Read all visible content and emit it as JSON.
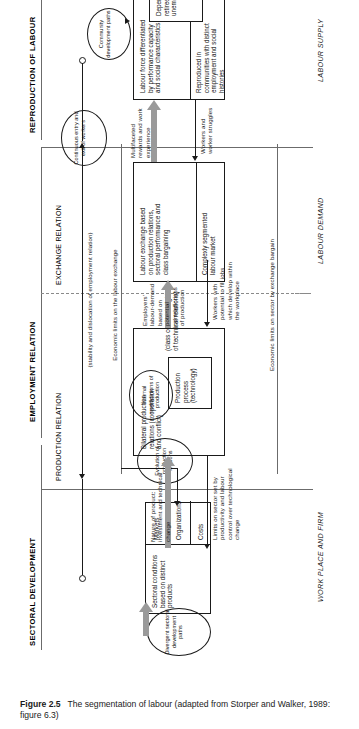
{
  "figure": {
    "number": "Figure 2.5",
    "caption": "The segmentation of labour (adapted from Storper and Walker, 1989: figure 6.3)"
  },
  "bands": [
    {
      "id": "sectoral",
      "heading": "SECTORAL DEVELOPMENT",
      "subheadings": [],
      "role": "WORK PLACE AND FIRM"
    },
    {
      "id": "employment",
      "heading": "EMPLOYMENT RELATION",
      "subheadings": [
        "PRODUCTION RELATION",
        "EXCHANGE RELATION"
      ],
      "role": "LABOUR DEMAND"
    },
    {
      "id": "reproduction",
      "heading": "REPRODUCTION OF LABOUR",
      "subheadings": [],
      "role": "LABOUR SUPPLY"
    }
  ],
  "roles": {
    "work_place": "WORK PLACE AND FIRM",
    "labour_demand": "LABOUR DEMAND",
    "labour_supply": "LABOUR SUPPLY"
  },
  "axis_note": "(stability and dislocation of employment relation)",
  "boxes": {
    "sectoral_conditions": {
      "title": "Sectoral conditions based on distinct products",
      "rows": [
        "Markets",
        "Organizations",
        "Costs"
      ]
    },
    "bilateral": {
      "title": "Bilateral production relations (cooperation and conflict)",
      "inner": "Production process (technology)",
      "note": "(class conflict in light of technical relations)"
    },
    "labour_exchange": {
      "title": "Labour exchange based on production relations, sectoral performance and class bargaining",
      "segment": "Complexly segmented labour market"
    },
    "labour_force": {
      "title": "Labour force differentiated by performance capacity and social characteristics",
      "segment": "Reproduced in communities with distinct employment and social histories"
    },
    "dependents": {
      "title": "Dependents, retirees and unemployed"
    }
  },
  "ellipses": {
    "divergent": "Divergent sectoral development paths",
    "evolution": "Evolution of production relations",
    "internal": "Internal modifications of production",
    "continuous": "Continuous entry and exit of workers",
    "community": "Community development paths"
  },
  "flow_labels": {
    "nature_of_product": "Nature of product: investment and technical change",
    "limits_on_sector": "Limits on sector set by productivity and labour control over technological change",
    "employers_demand": "Employers' labour-demand based on potential contradictions of production",
    "workers_potential": "Workers with potential to fill jobs which develop within the workplace",
    "multifaceted": "Multifaceted rewards and work experience",
    "workers_struggles": "Workers and worker struggles",
    "econ_limits_exchange": "Economic limits on the labour exchange",
    "econ_limits_sector": "Economic limits on sector by exchange bargain"
  },
  "colors": {
    "ink": "#1a1a1a",
    "grey_arrow": "#9a9a9a",
    "rule": "#6b6b6b",
    "paper": "#ffffff"
  }
}
